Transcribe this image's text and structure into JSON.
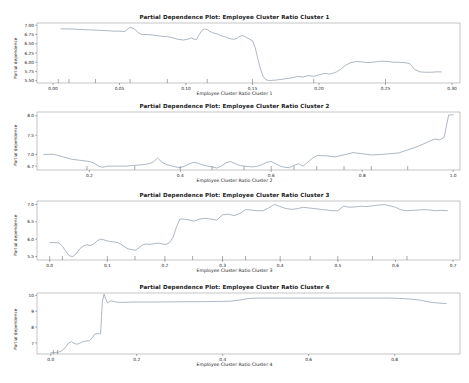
{
  "figure": {
    "background": "#ffffff",
    "line_color": "#7a8b9e",
    "axis_color": "#8a8a8a",
    "width": 469,
    "height": 383
  },
  "chart_data": [
    {
      "type": "line",
      "index": 0,
      "title": "Partial Dependence Plot: Employee Cluster Ratio Cluster 1",
      "xlabel": "Employee Cluster Ratio Cluster 1",
      "ylabel": "Partial dependence",
      "xlim": [
        -0.012,
        0.306
      ],
      "ylim": [
        5.44,
        7.06
      ],
      "xticks": [
        0.0,
        0.05,
        0.1,
        0.15,
        0.2,
        0.25,
        0.3
      ],
      "xticklabels": [
        "0.00",
        "0.05",
        "0.10",
        "0.15",
        "0.20",
        "0.25",
        "0.30"
      ],
      "yticks": [
        5.5,
        5.75,
        6.0,
        6.25,
        6.5,
        6.75,
        7.0
      ],
      "yticklabels": [
        "5.50",
        "5.75",
        "6.00",
        "6.25",
        "6.50",
        "6.75",
        "7.00"
      ],
      "grid": false,
      "legend": null,
      "rug_x": [
        0.004,
        0.012,
        0.032,
        0.058,
        0.086,
        0.116,
        0.15,
        0.196,
        0.25
      ],
      "x": [
        0.006,
        0.012,
        0.018,
        0.024,
        0.03,
        0.036,
        0.042,
        0.046,
        0.05,
        0.054,
        0.058,
        0.062,
        0.064,
        0.066,
        0.068,
        0.07,
        0.074,
        0.078,
        0.082,
        0.086,
        0.09,
        0.094,
        0.098,
        0.102,
        0.104,
        0.106,
        0.108,
        0.11,
        0.112,
        0.114,
        0.116,
        0.118,
        0.12,
        0.124,
        0.126,
        0.128,
        0.13,
        0.132,
        0.134,
        0.136,
        0.138,
        0.14,
        0.142,
        0.144,
        0.146,
        0.148,
        0.15,
        0.152,
        0.154,
        0.156,
        0.158,
        0.16,
        0.162,
        0.164,
        0.168,
        0.172,
        0.176,
        0.18,
        0.184,
        0.188,
        0.192,
        0.196,
        0.2,
        0.204,
        0.208,
        0.212,
        0.216,
        0.22,
        0.224,
        0.228,
        0.232,
        0.236,
        0.24,
        0.244,
        0.248,
        0.252,
        0.256,
        0.26,
        0.264,
        0.268,
        0.272,
        0.276,
        0.28,
        0.284,
        0.288,
        0.292
      ],
      "y": [
        6.9,
        6.9,
        6.89,
        6.88,
        6.87,
        6.86,
        6.85,
        6.84,
        6.84,
        6.83,
        6.95,
        6.88,
        6.8,
        6.76,
        6.75,
        6.75,
        6.74,
        6.72,
        6.7,
        6.69,
        6.66,
        6.62,
        6.6,
        6.63,
        6.66,
        6.62,
        6.62,
        6.75,
        6.86,
        6.9,
        6.88,
        6.83,
        6.8,
        6.76,
        6.72,
        6.7,
        6.68,
        6.65,
        6.63,
        6.62,
        6.64,
        6.69,
        6.72,
        6.7,
        6.66,
        6.62,
        6.58,
        6.4,
        6.1,
        5.82,
        5.62,
        5.53,
        5.51,
        5.51,
        5.52,
        5.54,
        5.56,
        5.58,
        5.62,
        5.6,
        5.64,
        5.62,
        5.66,
        5.7,
        5.68,
        5.72,
        5.8,
        5.92,
        5.99,
        6.02,
        6.01,
        5.99,
        6.0,
        6.02,
        6.03,
        6.02,
        6.0,
        6.0,
        5.99,
        5.97,
        5.8,
        5.74,
        5.73,
        5.73,
        5.74,
        5.74
      ]
    },
    {
      "type": "line",
      "index": 1,
      "title": "Partial Dependence Plot: Employee Cluster Ratio Cluster 2",
      "xlabel": "Employee Cluster Ratio Cluster 2",
      "ylabel": "Partial dependence",
      "xlim": [
        0.085,
        1.015
      ],
      "ylim": [
        6.6,
        8.1
      ],
      "xticks": [
        0.2,
        0.4,
        0.6,
        0.8,
        1.0
      ],
      "xticklabels": [
        "0.2",
        "0.4",
        "0.6",
        "0.8",
        "1.0"
      ],
      "yticks": [
        6.7,
        7.0,
        7.5,
        8.0
      ],
      "yticklabels": [
        "6.7",
        "7.0",
        "7.5",
        "8.0"
      ],
      "grid": false,
      "legend": null,
      "rug_x": [
        0.195,
        0.3,
        0.4,
        0.47,
        0.54,
        0.6,
        0.65,
        0.7,
        0.76,
        0.82,
        0.9
      ],
      "x": [
        0.1,
        0.12,
        0.14,
        0.16,
        0.18,
        0.2,
        0.21,
        0.22,
        0.23,
        0.24,
        0.25,
        0.26,
        0.27,
        0.28,
        0.29,
        0.3,
        0.31,
        0.32,
        0.33,
        0.34,
        0.35,
        0.36,
        0.37,
        0.38,
        0.39,
        0.4,
        0.41,
        0.42,
        0.43,
        0.44,
        0.45,
        0.46,
        0.47,
        0.48,
        0.49,
        0.5,
        0.51,
        0.52,
        0.53,
        0.54,
        0.55,
        0.56,
        0.57,
        0.58,
        0.59,
        0.6,
        0.61,
        0.62,
        0.63,
        0.64,
        0.65,
        0.66,
        0.67,
        0.68,
        0.69,
        0.7,
        0.72,
        0.74,
        0.76,
        0.78,
        0.8,
        0.82,
        0.84,
        0.86,
        0.88,
        0.9,
        0.92,
        0.94,
        0.95,
        0.96,
        0.97,
        0.98,
        0.99,
        1.0
      ],
      "y": [
        7.0,
        7.01,
        6.95,
        6.88,
        6.85,
        6.82,
        6.78,
        6.7,
        6.67,
        6.7,
        6.7,
        6.7,
        6.7,
        6.7,
        6.71,
        6.72,
        6.73,
        6.74,
        6.76,
        6.8,
        6.91,
        6.8,
        6.74,
        6.71,
        6.68,
        6.66,
        6.7,
        6.76,
        6.8,
        6.77,
        6.73,
        6.7,
        6.68,
        6.65,
        6.7,
        6.78,
        6.82,
        6.77,
        6.72,
        6.7,
        6.69,
        6.68,
        6.7,
        6.74,
        6.8,
        6.82,
        6.76,
        6.7,
        6.67,
        6.66,
        6.72,
        6.76,
        6.7,
        6.8,
        6.9,
        6.97,
        6.97,
        6.94,
        6.99,
        7.05,
        7.02,
        6.99,
        7.0,
        7.02,
        7.04,
        7.12,
        7.2,
        7.3,
        7.36,
        7.4,
        7.38,
        7.44,
        8.02,
        8.03
      ]
    },
    {
      "type": "line",
      "index": 2,
      "title": "Partial Dependence Plot: Employee Cluster Ratio Cluster 3",
      "xlabel": "Employee Cluster Ratio Cluster 3",
      "ylabel": "Partial dependence",
      "xlim": [
        -0.022,
        0.712
      ],
      "ylim": [
        5.4,
        7.1
      ],
      "xticks": [
        0.0,
        0.1,
        0.2,
        0.3,
        0.4,
        0.5,
        0.6,
        0.7
      ],
      "xticklabels": [
        "0.0",
        "0.1",
        "0.2",
        "0.3",
        "0.4",
        "0.5",
        "0.6",
        "0.7"
      ],
      "yticks": [
        5.5,
        6.0,
        6.5,
        7.0
      ],
      "yticklabels": [
        "5.5",
        "6.0",
        "6.5",
        "7.0"
      ],
      "grid": false,
      "legend": null,
      "rug_x": [
        0.0,
        0.022,
        0.1,
        0.148,
        0.2,
        0.248,
        0.3,
        0.34,
        0.4,
        0.452,
        0.5,
        0.56,
        0.62
      ],
      "x": [
        0.0,
        0.008,
        0.016,
        0.022,
        0.028,
        0.034,
        0.04,
        0.046,
        0.052,
        0.058,
        0.064,
        0.07,
        0.076,
        0.082,
        0.088,
        0.094,
        0.1,
        0.106,
        0.112,
        0.118,
        0.124,
        0.13,
        0.136,
        0.142,
        0.148,
        0.154,
        0.16,
        0.166,
        0.172,
        0.178,
        0.184,
        0.19,
        0.196,
        0.202,
        0.208,
        0.214,
        0.22,
        0.226,
        0.232,
        0.24,
        0.25,
        0.26,
        0.27,
        0.28,
        0.29,
        0.3,
        0.31,
        0.32,
        0.33,
        0.34,
        0.35,
        0.36,
        0.37,
        0.38,
        0.39,
        0.4,
        0.41,
        0.42,
        0.43,
        0.44,
        0.45,
        0.46,
        0.47,
        0.48,
        0.49,
        0.5,
        0.51,
        0.52,
        0.53,
        0.54,
        0.55,
        0.56,
        0.57,
        0.58,
        0.59,
        0.6,
        0.61,
        0.62,
        0.63,
        0.64,
        0.65,
        0.66,
        0.67,
        0.68,
        0.69
      ],
      "y": [
        5.9,
        5.9,
        5.89,
        5.8,
        5.65,
        5.52,
        5.5,
        5.58,
        5.72,
        5.8,
        5.84,
        5.82,
        5.85,
        5.95,
        6.0,
        5.98,
        5.95,
        5.93,
        5.92,
        5.9,
        5.85,
        5.78,
        5.72,
        5.7,
        5.68,
        5.74,
        5.82,
        5.86,
        5.85,
        5.86,
        5.88,
        5.88,
        5.86,
        5.85,
        5.9,
        6.05,
        6.35,
        6.58,
        6.58,
        6.56,
        6.52,
        6.58,
        6.6,
        6.58,
        6.55,
        6.7,
        6.72,
        6.68,
        6.74,
        6.85,
        6.84,
        6.82,
        6.82,
        6.9,
        7.0,
        6.94,
        6.88,
        6.86,
        6.88,
        6.92,
        6.9,
        6.88,
        6.86,
        6.84,
        6.82,
        6.82,
        6.95,
        6.92,
        6.93,
        6.95,
        6.94,
        6.96,
        6.98,
        7.0,
        6.96,
        6.92,
        6.84,
        6.82,
        6.83,
        6.84,
        6.85,
        6.84,
        6.82,
        6.83,
        6.82
      ]
    },
    {
      "type": "line",
      "index": 3,
      "title": "Partial Dependence Plot: Employee Cluster Ratio Cluster 4",
      "xlabel": "Employee Cluster Ratio Cluster 4",
      "ylabel": "Partial dependence",
      "xlim": [
        -0.032,
        0.952
      ],
      "ylim": [
        6.3,
        10.15
      ],
      "xticks": [
        0.0,
        0.2,
        0.4,
        0.6,
        0.8
      ],
      "xticklabels": [
        "0.0",
        "0.2",
        "0.4",
        "0.6",
        "0.8"
      ],
      "yticks": [
        7,
        8,
        9,
        10
      ],
      "yticklabels": [
        "7",
        "8",
        "9",
        "10"
      ],
      "grid": false,
      "legend": null,
      "rug_x": [
        0.006,
        0.016
      ],
      "x": [
        0.0,
        0.006,
        0.012,
        0.018,
        0.024,
        0.03,
        0.036,
        0.042,
        0.048,
        0.054,
        0.06,
        0.066,
        0.072,
        0.078,
        0.084,
        0.09,
        0.096,
        0.102,
        0.108,
        0.112,
        0.116,
        0.118,
        0.12,
        0.124,
        0.128,
        0.132,
        0.136,
        0.14,
        0.146,
        0.152,
        0.16,
        0.17,
        0.18,
        0.2,
        0.22,
        0.25,
        0.28,
        0.31,
        0.34,
        0.37,
        0.4,
        0.42,
        0.44,
        0.45,
        0.46,
        0.47,
        0.48,
        0.5,
        0.54,
        0.58,
        0.62,
        0.66,
        0.7,
        0.74,
        0.78,
        0.8,
        0.82,
        0.84,
        0.86,
        0.87,
        0.88,
        0.89,
        0.9,
        0.91,
        0.92
      ],
      "y": [
        6.38,
        6.38,
        6.4,
        6.42,
        6.48,
        6.6,
        6.78,
        7.0,
        7.08,
        6.98,
        6.92,
        6.96,
        7.05,
        7.1,
        7.12,
        7.14,
        7.3,
        7.55,
        7.58,
        7.58,
        7.58,
        8.6,
        9.6,
        10.08,
        9.78,
        9.52,
        9.6,
        9.66,
        9.62,
        9.58,
        9.56,
        9.56,
        9.57,
        9.58,
        9.58,
        9.58,
        9.59,
        9.6,
        9.6,
        9.61,
        9.62,
        9.64,
        9.7,
        9.76,
        9.8,
        9.82,
        9.83,
        9.83,
        9.83,
        9.83,
        9.83,
        9.83,
        9.83,
        9.83,
        9.83,
        9.82,
        9.8,
        9.76,
        9.7,
        9.64,
        9.58,
        9.55,
        9.52,
        9.5,
        9.48
      ]
    }
  ]
}
